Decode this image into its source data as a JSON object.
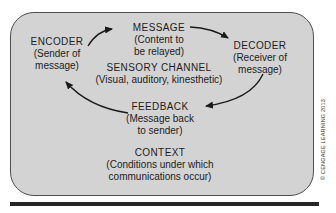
{
  "colors": {
    "background": "#ffffff",
    "panel_fill": "#d3d3d3",
    "panel_border": "#4f4f4f",
    "text": "#1c1c1c",
    "arrow": "#1a1a1a",
    "bottom_bar": "#262626"
  },
  "diagram": {
    "nodes": {
      "message": {
        "lines": [
          "MESSAGE",
          "(Content to",
          "be relayed)"
        ]
      },
      "encoder": {
        "lines": [
          "ENCODER",
          "(Sender of",
          "message)"
        ]
      },
      "decoder": {
        "lines": [
          "DECODER",
          "(Receiver of",
          "message)"
        ]
      },
      "sensory_channel": {
        "lines": [
          "SENSORY CHANNEL",
          "(Visual, auditory, kinesthetic)"
        ]
      },
      "feedback": {
        "lines": [
          "FEEDBACK",
          "(Message back",
          "to sender)"
        ]
      },
      "context": {
        "lines": [
          "CONTEXT",
          "(Conditions under which",
          "communications occur)"
        ]
      }
    },
    "arrows": [
      {
        "from": "encoder",
        "to": "message"
      },
      {
        "from": "message",
        "to": "decoder"
      },
      {
        "from": "decoder",
        "to": "feedback"
      },
      {
        "from": "feedback",
        "to": "encoder"
      }
    ],
    "credit": "© CENGAGE LEARNING 2013"
  }
}
